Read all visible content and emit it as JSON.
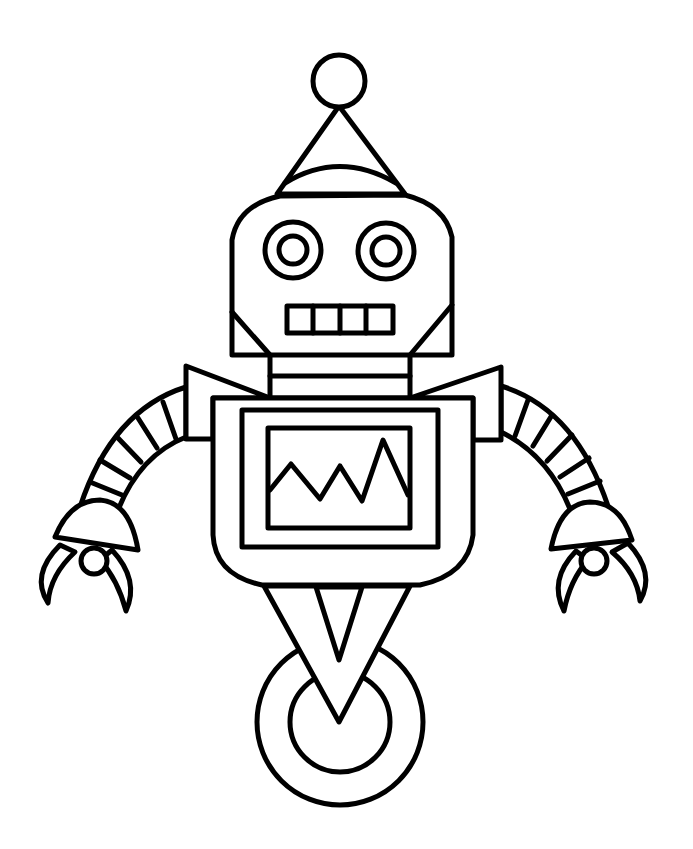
{
  "image": {
    "kind": "coloring-page line art",
    "subject": "robot",
    "background_color": "#ffffff",
    "line_color": "#000000",
    "parts": {
      "antenna": {
        "ball": "circle",
        "cone": "triangle hat"
      },
      "head": {
        "eyes": 2,
        "eye_style": "concentric circles",
        "mouth_teeth": 4
      },
      "neck": {
        "bands": 2
      },
      "shoulders": 2,
      "arms": {
        "count": 2,
        "segments_each": 5,
        "hands": "claw with dome and ball"
      },
      "body": {
        "screen": "double-framed monitor",
        "screen_graph": "zigzag line"
      },
      "base": {
        "connector": "inverted V",
        "wheel": "double circle"
      }
    }
  }
}
